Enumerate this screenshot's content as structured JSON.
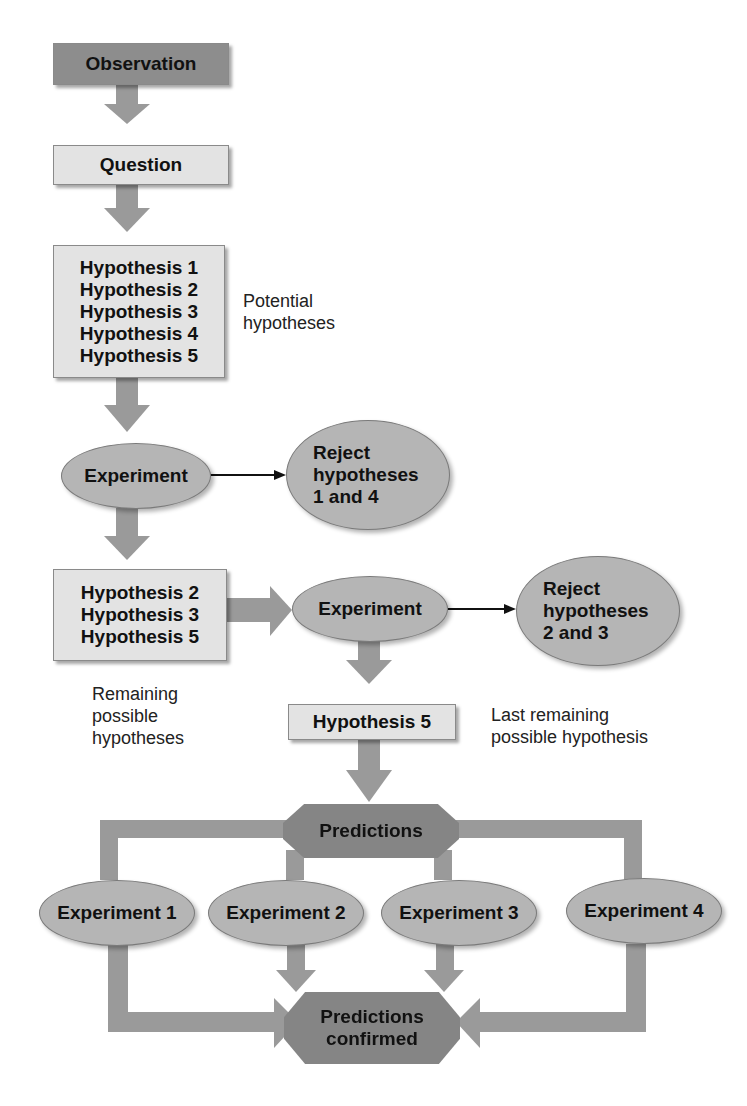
{
  "diagram": {
    "observation": "Observation",
    "question": "Question",
    "hypotheses_all": [
      "Hypothesis 1",
      "Hypothesis 2",
      "Hypothesis 3",
      "Hypothesis 4",
      "Hypothesis 5"
    ],
    "potential_label": [
      "Potential",
      "hypotheses"
    ],
    "experiment_a": "Experiment",
    "reject_a": [
      "Reject",
      "hypotheses",
      "1 and 4"
    ],
    "hypotheses_remaining": [
      "Hypothesis 2",
      "Hypothesis 3",
      "Hypothesis 5"
    ],
    "remaining_label": [
      "Remaining",
      "possible",
      "hypotheses"
    ],
    "experiment_b": "Experiment",
    "reject_b": [
      "Reject",
      "hypotheses",
      "2 and 3"
    ],
    "hypothesis_final": "Hypothesis 5",
    "last_label": [
      "Last remaining",
      "possible hypothesis"
    ],
    "predictions": "Predictions",
    "experiments": [
      "Experiment 1",
      "Experiment 2",
      "Experiment 3",
      "Experiment 4"
    ],
    "confirmed": [
      "Predictions",
      "confirmed"
    ]
  },
  "colors": {
    "arrow": "#9a9a9a",
    "dark_box": "#8d8d8d",
    "light_box": "#e3e3e3",
    "ellipse": "#b5b5b5"
  }
}
